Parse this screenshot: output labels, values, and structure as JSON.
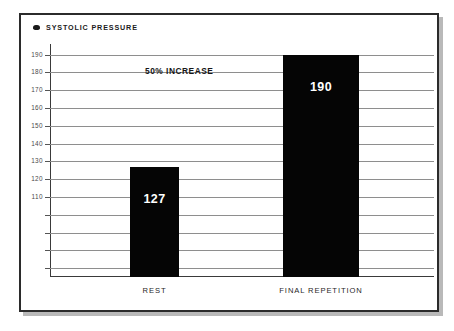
{
  "legend": {
    "marker_icon": "series-marker-icon",
    "label": "SYSTOLIC PRESSURE",
    "color": "#050505"
  },
  "annotation": {
    "text": "50% INCREASE"
  },
  "axis": {
    "y_tick_labels": [
      "190",
      "180",
      "170",
      "160",
      "150",
      "140",
      "130",
      "120",
      "110"
    ],
    "x_tick_labels": [
      "REST",
      "FINAL REPETITION"
    ]
  },
  "bars": [
    {
      "name": "rest-bar",
      "category": "REST",
      "value": 127,
      "value_label": "127"
    },
    {
      "name": "final-repetition-bar",
      "category": "FINAL REPETITION",
      "value": 190,
      "value_label": "190"
    }
  ],
  "chart_data": {
    "type": "bar",
    "title": "SYSTOLIC PRESSURE",
    "categories": [
      "REST",
      "FINAL REPETITION"
    ],
    "values": [
      127,
      190
    ],
    "data_labels": [
      "127",
      "190"
    ],
    "series": [
      {
        "name": "SYSTOLIC PRESSURE",
        "values": [
          127,
          190
        ],
        "color": "#050505"
      }
    ],
    "xlabel": "",
    "ylabel": "",
    "ylim": [
      65,
      196
    ],
    "yticks": [
      190,
      180,
      170,
      160,
      150,
      140,
      130,
      120,
      110
    ],
    "ytick_labels": [
      "190",
      "180",
      "170",
      "160",
      "150",
      "140",
      "130",
      "120",
      "110"
    ],
    "unlabeled_gridlines": [
      100,
      90,
      80,
      70
    ],
    "grid": true,
    "grid_axis": "y",
    "legend": true,
    "legend_position": "top-left",
    "annotations": [
      {
        "text": "50% INCREASE",
        "x": "between-bars",
        "y": 181
      }
    ],
    "bar_color": "#050505",
    "data_label_color": "#ffffff",
    "background": "#ffffff"
  }
}
